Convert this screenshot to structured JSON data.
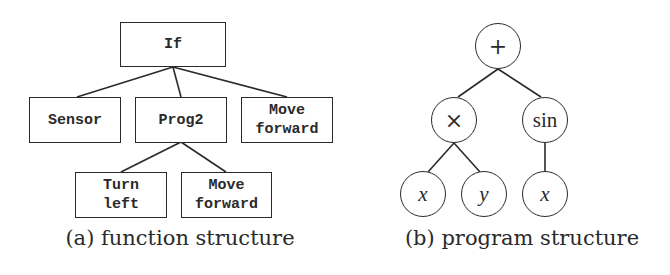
{
  "left_panel": {
    "caption": "(a) function structure",
    "nodes": {
      "root": "If",
      "sensor": "Sensor",
      "prog2": "Prog2",
      "move_forward_1": "Move\nforward",
      "turn_left": "Turn\nleft",
      "move_forward_2": "Move\nforward"
    },
    "edges": [
      [
        "If",
        "Sensor"
      ],
      [
        "If",
        "Prog2"
      ],
      [
        "If",
        "Move forward"
      ],
      [
        "Prog2",
        "Turn left"
      ],
      [
        "Prog2",
        "Move forward"
      ]
    ]
  },
  "right_panel": {
    "caption": "(b) program structure",
    "nodes": {
      "root": "+",
      "times": "×",
      "sin": "sin",
      "leaf_x1": "x",
      "leaf_y": "y",
      "leaf_x2": "x"
    },
    "edges": [
      [
        "+",
        "×"
      ],
      [
        "+",
        "sin"
      ],
      [
        "×",
        "x"
      ],
      [
        "×",
        "y"
      ],
      [
        "sin",
        "x"
      ]
    ]
  },
  "colors": {
    "stroke": "#2a2a2a",
    "background": "#ffffff"
  }
}
